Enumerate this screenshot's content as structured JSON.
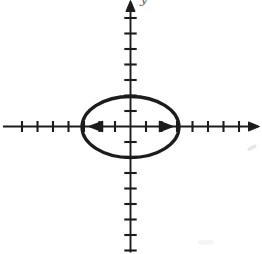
{
  "figure": {
    "colors": {
      "background": "#ffffff",
      "ink": "#1c1c1c",
      "label_gray": "#707070"
    },
    "axes": {
      "y_label": "y",
      "y_label_pos": {
        "x": 140,
        "y": 3
      },
      "origin": {
        "x": 130.5,
        "y": 126.5
      },
      "tick_spacing": 15.5,
      "arrowhead": {
        "length": 11,
        "half_width": 4.6
      },
      "x_axis": {
        "line_start": 3,
        "arrow_tip": 259.5,
        "ticks_left": 7,
        "ticks_right": 7,
        "tick_half_len": 5.5,
        "stroke_width": 1.9
      },
      "y_axis": {
        "line_bottom": 252.5,
        "arrow_tip": 0.5,
        "ticks_above": 7,
        "ticks_below": 8,
        "tick_half_len": 6.2,
        "stroke_width": 1.9
      },
      "tick_stroke_width": 2.1
    },
    "ellipse": {
      "cx": 130.5,
      "cy": 127,
      "rx": 48.5,
      "ry": 30.5,
      "stroke_width": 3.3,
      "semi_major_units": 3,
      "semi_minor_units": 2,
      "orientation": "horizontal"
    },
    "major_axis_arrows": {
      "y": 126.5,
      "left_tip": 89.5,
      "right_tip": 172.5,
      "length": 13,
      "half_height": 5
    },
    "artifacts": [
      {
        "x": 247,
        "y": 146,
        "w": 10,
        "h": 3.5,
        "rot": -28,
        "opacity": 0.1
      },
      {
        "x": 198,
        "y": 240,
        "w": 16,
        "h": 5,
        "rot": 0,
        "opacity": 0.04
      }
    ]
  }
}
